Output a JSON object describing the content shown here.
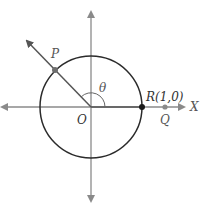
{
  "diagram": {
    "title": "",
    "labels": {
      "p": "P",
      "theta": "θ",
      "r": "R(1,0)",
      "x_axis": "X",
      "o": "O",
      "q": "Q"
    },
    "colors": {
      "axis": "#8a8a8a",
      "circle": "#2b2b2b",
      "ray": "#555555",
      "point_r": "#1a1a1a",
      "point_p": "#6e6e6e",
      "point_q": "#8a8a8a"
    }
  }
}
